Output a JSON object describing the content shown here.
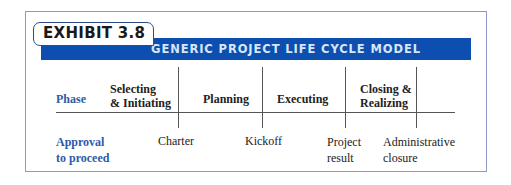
{
  "exhibit": {
    "label": "EXHIBIT 3.8",
    "title": "GENERIC PROJECT LIFE CYCLE MODEL"
  },
  "colors": {
    "header_bar": "#0c4fb0",
    "header_text": "#d9e6f7",
    "accent_text": "#2e5aa8",
    "frame_border": "#8a9cc6"
  },
  "phase_row": {
    "label": "Phase",
    "phases": [
      {
        "line1": "Selecting",
        "line2": "& Initiating"
      },
      {
        "line1": "Planning",
        "line2": ""
      },
      {
        "line1": "Executing",
        "line2": ""
      },
      {
        "line1": "Closing &",
        "line2": "Realizing"
      }
    ]
  },
  "approval_row": {
    "label_line1": "Approval",
    "label_line2": "to proceed",
    "milestones": [
      {
        "line1": "Charter",
        "line2": ""
      },
      {
        "line1": "Kickoff",
        "line2": ""
      },
      {
        "line1": "Project",
        "line2": "result"
      },
      {
        "line1": "Administrative",
        "line2": "closure"
      }
    ]
  }
}
